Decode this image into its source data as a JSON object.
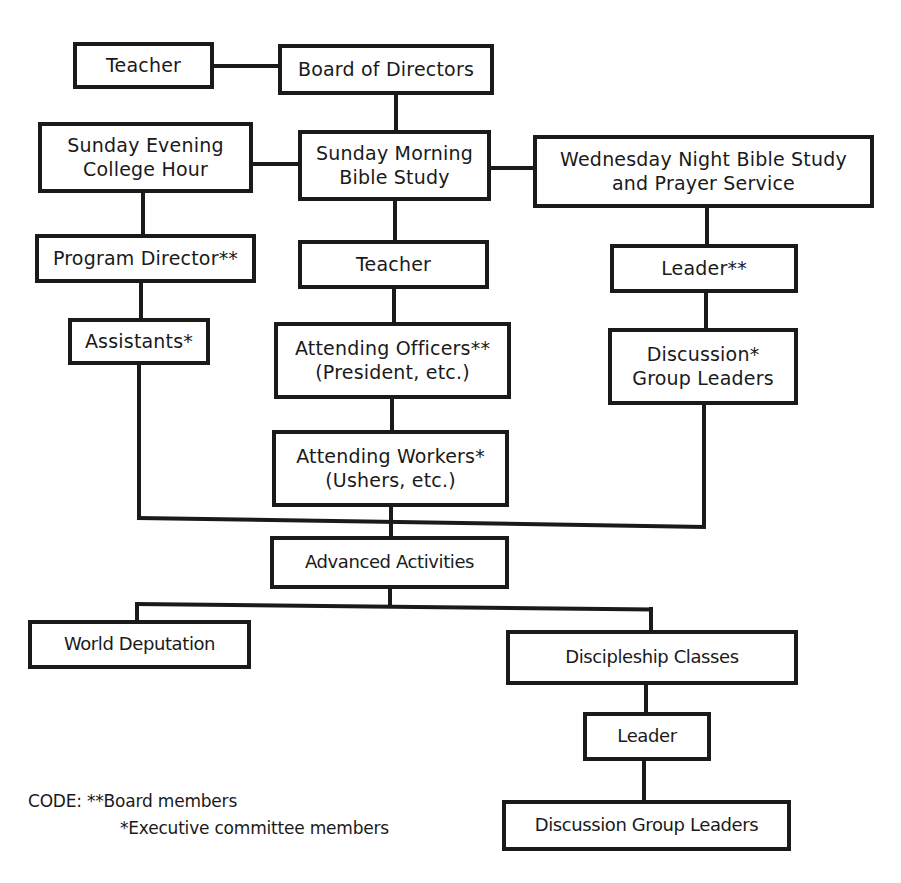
{
  "diagram": {
    "type": "organizational chart",
    "colors": {
      "line": "#1a1a1a",
      "box_fill": "#ffffff",
      "background": "#ffffff"
    },
    "nodes": {
      "teacher_top": {
        "lines": [
          "Teacher"
        ]
      },
      "board_of_directors": {
        "lines": [
          "Board of Directors"
        ]
      },
      "sunday_evening": {
        "lines": [
          "Sunday Evening",
          "College Hour"
        ]
      },
      "sunday_morning": {
        "lines": [
          "Sunday Morning",
          "Bible Study"
        ]
      },
      "wednesday_night": {
        "lines": [
          "Wednesday Night Bible Study",
          "and Prayer Service"
        ]
      },
      "program_director": {
        "lines": [
          "Program Director**"
        ]
      },
      "teacher_mid": {
        "lines": [
          "Teacher"
        ]
      },
      "leader_wed": {
        "lines": [
          "Leader**"
        ]
      },
      "assistants": {
        "lines": [
          "Assistants*"
        ]
      },
      "attending_officers": {
        "lines": [
          "Attending Officers**",
          "(President, etc.)"
        ]
      },
      "discussion_leaders_wed": {
        "lines": [
          "Discussion*",
          "Group Leaders"
        ]
      },
      "attending_workers": {
        "lines": [
          "Attending Workers*",
          "(Ushers, etc.)"
        ]
      },
      "advanced_activities": {
        "lines": [
          "Advanced Activities"
        ]
      },
      "world_deputation": {
        "lines": [
          "World Deputation"
        ]
      },
      "discipleship_classes": {
        "lines": [
          "Discipleship Classes"
        ]
      },
      "leader_discipleship": {
        "lines": [
          "Leader"
        ]
      },
      "discussion_group_leaders": {
        "lines": [
          "Discussion Group Leaders"
        ]
      }
    },
    "edges": [
      [
        "teacher_top",
        "board_of_directors"
      ],
      [
        "board_of_directors",
        "sunday_morning"
      ],
      [
        "sunday_evening",
        "sunday_morning"
      ],
      [
        "sunday_morning",
        "wednesday_night"
      ],
      [
        "sunday_evening",
        "program_director"
      ],
      [
        "program_director",
        "assistants"
      ],
      [
        "sunday_morning",
        "teacher_mid"
      ],
      [
        "teacher_mid",
        "attending_officers"
      ],
      [
        "attending_officers",
        "attending_workers"
      ],
      [
        "wednesday_night",
        "leader_wed"
      ],
      [
        "leader_wed",
        "discussion_leaders_wed"
      ],
      [
        "assistants",
        "advanced_activities"
      ],
      [
        "attending_workers",
        "advanced_activities"
      ],
      [
        "discussion_leaders_wed",
        "advanced_activities"
      ],
      [
        "advanced_activities",
        "world_deputation"
      ],
      [
        "advanced_activities",
        "discipleship_classes"
      ],
      [
        "discipleship_classes",
        "leader_discipleship"
      ],
      [
        "leader_discipleship",
        "discussion_group_leaders"
      ]
    ],
    "legend": {
      "label": "CODE:",
      "items": [
        {
          "marker": "**",
          "text": "Board members"
        },
        {
          "marker": "*",
          "text": "Executive committee members"
        }
      ],
      "row1": "CODE:  **Board members",
      "row2": "*Executive committee members"
    }
  }
}
